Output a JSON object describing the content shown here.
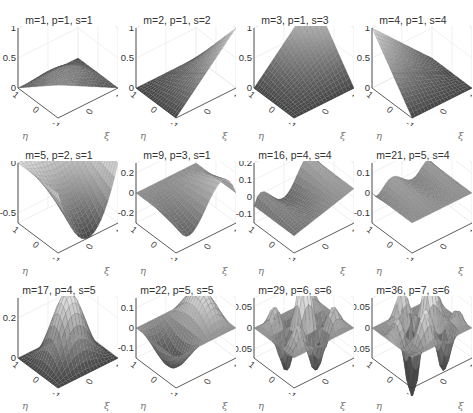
{
  "header": {
    "text": ""
  },
  "chart_data": {
    "type": "surface-grid",
    "title": "",
    "layout": {
      "rows": 3,
      "cols": 4
    },
    "axes": {
      "x_label": "ξ",
      "y_label": "η",
      "x_ticks": [
        "-1",
        "0",
        "1"
      ],
      "y_ticks": [
        "-1",
        "0",
        "1"
      ]
    },
    "panels": [
      {
        "title": "m=1, p=1, s=1",
        "m": 1,
        "p": 1,
        "s": 1,
        "zticks": [
          "0",
          "0.5",
          "1"
        ],
        "zlim": [
          0,
          1
        ],
        "shape": "bubble-bilinear"
      },
      {
        "title": "m=2, p=1, s=2",
        "m": 2,
        "p": 1,
        "s": 2,
        "zticks": [
          "0",
          "0.5",
          "1"
        ],
        "zlim": [
          0,
          1
        ],
        "shape": "corner-rise-xi"
      },
      {
        "title": "m=3, p=1, s=3",
        "m": 3,
        "p": 1,
        "s": 3,
        "zticks": [
          "0",
          "0.5",
          "1"
        ],
        "zlim": [
          0,
          1
        ],
        "shape": "corner-peak-back"
      },
      {
        "title": "m=4, p=1, s=4",
        "m": 4,
        "p": 1,
        "s": 4,
        "zticks": [
          "0",
          "0.5",
          "1"
        ],
        "zlim": [
          0,
          1
        ],
        "shape": "corner-rise-eta"
      },
      {
        "title": "m=5, p=2, s=1",
        "m": 5,
        "p": 2,
        "s": 1,
        "zticks": [
          "-0.5",
          "0"
        ],
        "zlim": [
          -0.6,
          0
        ],
        "shape": "edge-parabola"
      },
      {
        "title": "m=9, p=3, s=1",
        "m": 9,
        "p": 3,
        "s": 1,
        "zticks": [
          "-0.2",
          "0",
          "0.2"
        ],
        "zlim": [
          -0.3,
          0.3
        ],
        "shape": "edge-cubic"
      },
      {
        "title": "m=16, p=4, s=4",
        "m": 16,
        "p": 4,
        "s": 4,
        "zticks": [
          "-0.1",
          "0",
          "0.1",
          "0.2"
        ],
        "zlim": [
          -0.15,
          0.2
        ],
        "shape": "edge-quartic"
      },
      {
        "title": "m=21, p=5, s=4",
        "m": 21,
        "p": 5,
        "s": 4,
        "zticks": [
          "-0.1",
          "0",
          "0.1"
        ],
        "zlim": [
          -0.15,
          0.15
        ],
        "shape": "edge-quintic"
      },
      {
        "title": "m=17, p=4, s=5",
        "m": 17,
        "p": 4,
        "s": 5,
        "zticks": [
          "0",
          "0.2"
        ],
        "zlim": [
          0,
          0.3
        ],
        "shape": "interior-bubble"
      },
      {
        "title": "m=22, p=5, s=5",
        "m": 22,
        "p": 5,
        "s": 5,
        "zticks": [
          "-0.1",
          "0",
          "0.1"
        ],
        "zlim": [
          -0.15,
          0.15
        ],
        "shape": "interior-odd"
      },
      {
        "title": "m=29, p=6, s=6",
        "m": 29,
        "p": 6,
        "s": 6,
        "zticks": [
          "-0.05",
          "0",
          "0.05"
        ],
        "zlim": [
          -0.07,
          0.07
        ],
        "shape": "interior-quad"
      },
      {
        "title": "m=36, p=7, s=6",
        "m": 36,
        "p": 7,
        "s": 6,
        "zticks": [
          "-0.05",
          "0",
          "0.05"
        ],
        "zlim": [
          -0.07,
          0.07
        ],
        "shape": "interior-mixed"
      }
    ]
  },
  "labels": {
    "eta": "η",
    "xi": "ξ",
    "tick_neg1": "-1",
    "tick_0": "0",
    "tick_1": "1"
  }
}
